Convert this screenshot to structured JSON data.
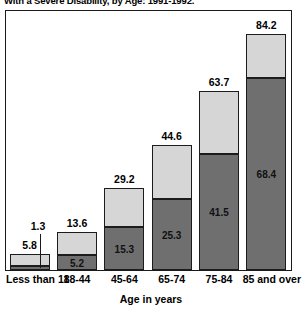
{
  "chart_data": {
    "type": "bar",
    "subtype": "stacked",
    "title": "With a Severe Disability, by Age: 1991-1992.",
    "xlabel": "Age in years",
    "ylabel": "",
    "grid": false,
    "legend": "none",
    "ylim": [
      0,
      92
    ],
    "categories": [
      "Less than 18",
      "18-44",
      "45-64",
      "65-74",
      "75-84",
      "85 and over"
    ],
    "series": [
      {
        "name": "Severe disability",
        "style": "dark",
        "color": "#6f6f6f",
        "values": [
          1.3,
          5.2,
          15.3,
          25.3,
          41.5,
          68.4
        ]
      },
      {
        "name": "Remainder to total",
        "style": "light",
        "color": "#d6d6d6",
        "values": [
          4.5,
          8.4,
          13.9,
          19.3,
          22.2,
          15.8
        ]
      }
    ],
    "totals": [
      5.8,
      13.6,
      29.2,
      44.6,
      63.7,
      84.2
    ],
    "bars": [
      {
        "category": "Less than 18",
        "total": 5.8,
        "total_label": "5.8",
        "dark_value": 1.3,
        "dark_label": "1.3",
        "dark_label_callout": true,
        "light_value": 4.5
      },
      {
        "category": "18-44",
        "total": 13.6,
        "total_label": "13.6",
        "dark_value": 5.2,
        "dark_label": "5.2",
        "dark_label_callout": false,
        "light_value": 8.4
      },
      {
        "category": "45-64",
        "total": 29.2,
        "total_label": "29.2",
        "dark_value": 15.3,
        "dark_label": "15.3",
        "dark_label_callout": false,
        "light_value": 13.9
      },
      {
        "category": "65-74",
        "total": 44.6,
        "total_label": "44.6",
        "dark_value": 25.3,
        "dark_label": "25.3",
        "dark_label_callout": false,
        "light_value": 19.3
      },
      {
        "category": "75-84",
        "total": 63.7,
        "total_label": "63.7",
        "dark_value": 41.5,
        "dark_label": "41.5",
        "dark_label_callout": false,
        "light_value": 22.2
      },
      {
        "category": "85 and over",
        "total": 84.2,
        "total_label": "84.2",
        "dark_value": 68.4,
        "dark_label": "68.4",
        "dark_label_callout": false,
        "light_value": 15.8
      }
    ],
    "colors": {
      "dark_segment": "#6f6f6f",
      "light_segment": "#d6d6d6",
      "outline": "#1c1c1c",
      "frame": "#1a1a1a",
      "background": "#ffffff",
      "text": "#000000"
    }
  }
}
